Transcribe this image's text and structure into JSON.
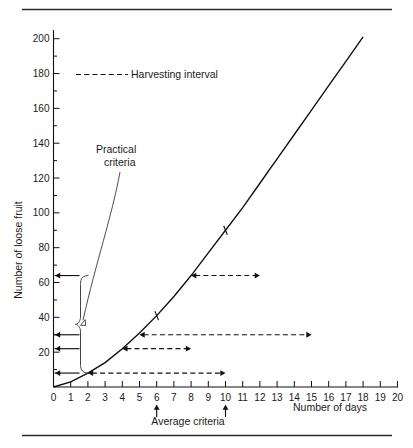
{
  "chart_data": {
    "type": "line",
    "title": "",
    "xlabel": "Number of days",
    "ylabel": "Number of loose fruit",
    "xlim": [
      0,
      20
    ],
    "ylim": [
      0,
      205
    ],
    "grid": false,
    "x_ticks": [
      0,
      1,
      2,
      3,
      4,
      5,
      6,
      7,
      8,
      9,
      10,
      11,
      12,
      13,
      14,
      15,
      16,
      17,
      18,
      19,
      20
    ],
    "x_tick_labels": [
      "0",
      "1",
      "2",
      "3",
      "4",
      "5",
      "6",
      "7",
      "8",
      "9",
      "10",
      "11",
      "12",
      "13",
      "14",
      "15",
      "16",
      "17",
      "18",
      "19",
      "20"
    ],
    "y_ticks": [
      0,
      10,
      20,
      30,
      40,
      50,
      60,
      70,
      80,
      90,
      100,
      110,
      120,
      130,
      140,
      150,
      160,
      170,
      180,
      190,
      200
    ],
    "y_major_ticks": [
      20,
      40,
      60,
      80,
      100,
      120,
      140,
      160,
      180,
      200
    ],
    "y_tick_labels": [
      "20",
      "40",
      "60",
      "80",
      "100",
      "120",
      "140",
      "160",
      "180",
      "200"
    ],
    "series": [
      {
        "name": "Loose fruit accumulation",
        "x": [
          0,
          1,
          2,
          3,
          4,
          5,
          6,
          7,
          8,
          9,
          10,
          11,
          12,
          13,
          14,
          15,
          16,
          17,
          18
        ],
        "values": [
          0,
          3,
          8,
          14,
          22,
          31,
          41,
          52,
          64,
          77,
          90,
          103,
          117,
          131,
          145,
          159,
          173,
          187,
          201
        ]
      }
    ],
    "curve_markers": [
      {
        "x": 6,
        "y": 41
      },
      {
        "x": 10,
        "y": 90
      }
    ],
    "legend": {
      "position": "top-left-inside",
      "entries": [
        {
          "label": "Harvesting interval",
          "style": "dashed-line"
        }
      ]
    },
    "annotations": [
      {
        "name": "practical-criteria",
        "text_line1": "Practical",
        "text_line2": "criteria",
        "points_to_x": 1.6,
        "points_to_y": 36
      },
      {
        "name": "average-criteria",
        "text": "Average criteria",
        "marks_x": [
          6,
          10
        ]
      },
      {
        "name": "practical-criteria-brace",
        "y_from": 8,
        "y_to": 64
      }
    ],
    "harvesting_intervals": [
      {
        "from_x": 2,
        "to_x": 10,
        "y": 8
      },
      {
        "from_x": 4,
        "to_x": 8,
        "y": 22
      },
      {
        "from_x": 5,
        "to_x": 15,
        "y": 30
      },
      {
        "from_x": 8,
        "to_x": 12,
        "y": 64
      }
    ],
    "y_axis_pointers": [
      64,
      30,
      22,
      8
    ]
  },
  "legend": {
    "harvesting_interval_label": "Harvesting interval"
  },
  "labels": {
    "y_axis_title": "Number of loose fruit",
    "x_axis_title": "Number of days",
    "practical_criteria_line1": "Practical",
    "practical_criteria_line2": "criteria",
    "average_criteria": "Average criteria"
  },
  "x_tick_labels": [
    "0",
    "1",
    "2",
    "3",
    "4",
    "5",
    "6",
    "7",
    "8",
    "9",
    "10",
    "11",
    "12",
    "13",
    "14",
    "15",
    "16",
    "17",
    "18",
    "19",
    "20"
  ],
  "y_tick_labels": [
    "20",
    "40",
    "60",
    "80",
    "100",
    "120",
    "140",
    "160",
    "180",
    "200"
  ],
  "colors": {
    "ink": "#111111",
    "rule": "#2b2b2b",
    "background": "#ffffff"
  }
}
